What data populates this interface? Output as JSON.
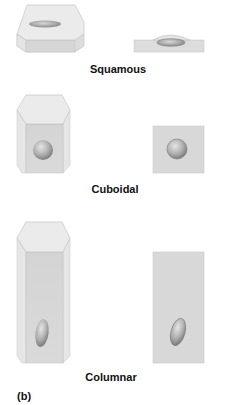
{
  "figure": {
    "panel_label": "(b)",
    "rows": [
      {
        "name": "Squamous",
        "label": "Squamous"
      },
      {
        "name": "Cuboidal",
        "label": "Cuboidal"
      },
      {
        "name": "Columnar",
        "label": "Columnar"
      }
    ],
    "colors": {
      "cell_top": "#e9e9e9",
      "cell_front": "#d6d6d6",
      "cell_side": "#e2e2e2",
      "cell_edge": "#b8b8b8",
      "nucleus_light": "#dcdcdc",
      "nucleus_dark": "#8a8a8a"
    }
  }
}
